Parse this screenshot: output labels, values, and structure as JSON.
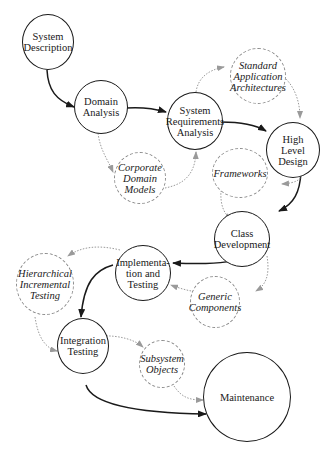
{
  "diagram": {
    "colors": {
      "process_border": "#1a1a1a",
      "asset_border": "#8a8a8a",
      "main_flow": "#1a1a1a",
      "reuse_flow": "#8a8a8a",
      "background": "#ffffff"
    },
    "process_nodes": [
      {
        "id": "system-description",
        "label": "System\nDescription"
      },
      {
        "id": "domain-analysis",
        "label": "Domain\nAnalysis"
      },
      {
        "id": "system-requirements-analysis",
        "label": "System\nRequirements\nAnalysis"
      },
      {
        "id": "high-level-design",
        "label": "High\nLevel\nDesign"
      },
      {
        "id": "class-development",
        "label": "Class\nDevelopment"
      },
      {
        "id": "implementation-and-testing",
        "label": "Implementa-\ntion and\nTesting"
      },
      {
        "id": "integration-testing",
        "label": "Integration\nTesting"
      },
      {
        "id": "maintenance",
        "label": "Maintenance"
      }
    ],
    "asset_nodes": [
      {
        "id": "standard-application-architectures",
        "label": "Standard\nApplication\nArchitectures"
      },
      {
        "id": "corporate-domain-models",
        "label": "Corporate\nDomain\nModels"
      },
      {
        "id": "frameworks",
        "label": "Frameworks"
      },
      {
        "id": "hierarchical-incremental-testing",
        "label": "Hierarchical\nIncremental\nTesting"
      },
      {
        "id": "generic-components",
        "label": "Generic\nComponents"
      },
      {
        "id": "subsystem-objects",
        "label": "Subsystem\nObjects"
      }
    ],
    "main_flow_edges": [
      [
        "system-description",
        "domain-analysis"
      ],
      [
        "domain-analysis",
        "system-requirements-analysis"
      ],
      [
        "system-requirements-analysis",
        "high-level-design"
      ],
      [
        "high-level-design",
        "class-development"
      ],
      [
        "class-development",
        "implementation-and-testing"
      ],
      [
        "implementation-and-testing",
        "integration-testing"
      ],
      [
        "integration-testing",
        "maintenance"
      ]
    ],
    "reuse_edges": [
      [
        "domain-analysis",
        "corporate-domain-models"
      ],
      [
        "corporate-domain-models",
        "system-requirements-analysis"
      ],
      [
        "system-requirements-analysis",
        "standard-application-architectures"
      ],
      [
        "standard-application-architectures",
        "high-level-design"
      ],
      [
        "high-level-design",
        "frameworks"
      ],
      [
        "frameworks",
        "class-development"
      ],
      [
        "class-development",
        "generic-components"
      ],
      [
        "generic-components",
        "implementation-and-testing"
      ],
      [
        "implementation-and-testing",
        "hierarchical-incremental-testing"
      ],
      [
        "hierarchical-incremental-testing",
        "integration-testing"
      ],
      [
        "integration-testing",
        "subsystem-objects"
      ],
      [
        "subsystem-objects",
        "maintenance"
      ]
    ]
  }
}
